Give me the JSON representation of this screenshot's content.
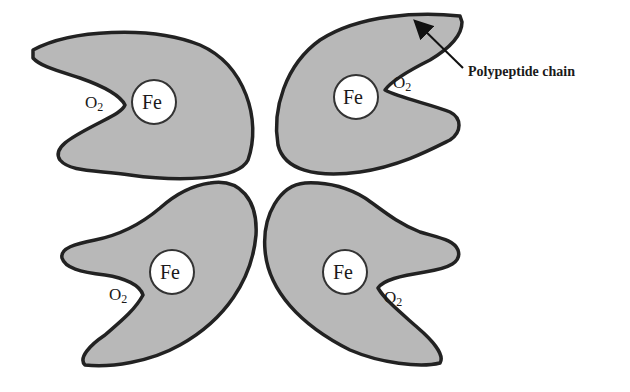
{
  "diagram": {
    "colors": {
      "subunit_fill": "#b8b8b8",
      "outline": "#222222",
      "heme_fill": "#ffffff",
      "background": "#ffffff"
    },
    "subunits": [
      {
        "position": "top-left",
        "heme_label": "Fe",
        "ligand_label": "O",
        "ligand_subscript": "2"
      },
      {
        "position": "top-right",
        "heme_label": "Fe",
        "ligand_label": "O",
        "ligand_subscript": "2"
      },
      {
        "position": "bottom-left",
        "heme_label": "Fe",
        "ligand_label": "O",
        "ligand_subscript": "2"
      },
      {
        "position": "bottom-right",
        "heme_label": "Fe",
        "ligand_label": "O",
        "ligand_subscript": "2"
      }
    ],
    "callout": {
      "label": "Polypeptide chain",
      "points_to": "top-right subunit outline"
    }
  }
}
